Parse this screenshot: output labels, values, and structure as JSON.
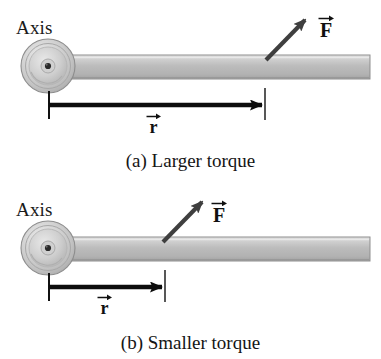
{
  "figure": {
    "width": 381,
    "height": 359,
    "background_color": "#ffffff"
  },
  "colors": {
    "rod_fill": "#b9b9b9",
    "rod_highlight": "#dcdcdc",
    "rod_shadow": "#9a9a9a",
    "rod_outline": "#8a8a8a",
    "hub_outer": "#c9c9c9",
    "hub_mid": "#d8d8d8",
    "hub_inner": "#bdbdbd",
    "hub_center": "#1b1b1b",
    "hub_outline": "#8d8d8d",
    "arrow_black": "#0d0d0d",
    "force_arrow_gray": "#4a4a4a",
    "text": "#151515"
  },
  "panels": [
    {
      "id": "panel-a",
      "axis_label": "Axis",
      "force_label": "F",
      "radius_label": "r",
      "caption": "(a) Larger torque",
      "description": "Force applied far from the axis gives a larger torque",
      "geometry": {
        "hub_center_x": 48,
        "hub_center_y": 66,
        "hub_outer_radius": 27,
        "rod_left_x": 60,
        "rod_right_x": 370,
        "rod_top_y": 55,
        "rod_bottom_y": 79,
        "force_application_x": 266,
        "force_application_y": 60,
        "force_tip_x": 308,
        "force_tip_y": 17,
        "r_arrow_y": 105,
        "r_arrow_start_x": 49,
        "r_arrow_end_x": 265,
        "tick_left_x": 49,
        "tick_right_x": 265,
        "tick_top_y": 91,
        "tick_bottom_y": 119
      },
      "measurements": {
        "lever_arm_px": 216,
        "relative_lever_arm": "long",
        "torque_magnitude": "larger"
      }
    },
    {
      "id": "panel-b",
      "axis_label": "Axis",
      "force_label": "F",
      "radius_label": "r",
      "caption": "(b) Smaller torque",
      "description": "Force applied close to the axis gives a smaller torque",
      "geometry": {
        "hub_center_x": 48,
        "hub_center_y": 248,
        "hub_outer_radius": 27,
        "rod_left_x": 60,
        "rod_right_x": 370,
        "rod_top_y": 237,
        "rod_bottom_y": 261,
        "force_application_x": 163,
        "force_application_y": 242,
        "force_tip_x": 205,
        "force_tip_y": 199,
        "r_arrow_y": 287,
        "r_arrow_start_x": 49,
        "r_arrow_end_x": 165,
        "tick_left_x": 49,
        "tick_right_x": 165,
        "tick_top_y": 273,
        "tick_bottom_y": 301
      },
      "measurements": {
        "lever_arm_px": 116,
        "relative_lever_arm": "short",
        "torque_magnitude": "smaller"
      }
    }
  ],
  "icons": {
    "pivot": "pivot-hub-icon",
    "rod": "lever-rod-icon",
    "force_arrow": "force-vector-arrow-icon",
    "radius_arrow": "radius-vector-arrow-icon",
    "vector_overbar": "vector-overbar-icon"
  }
}
